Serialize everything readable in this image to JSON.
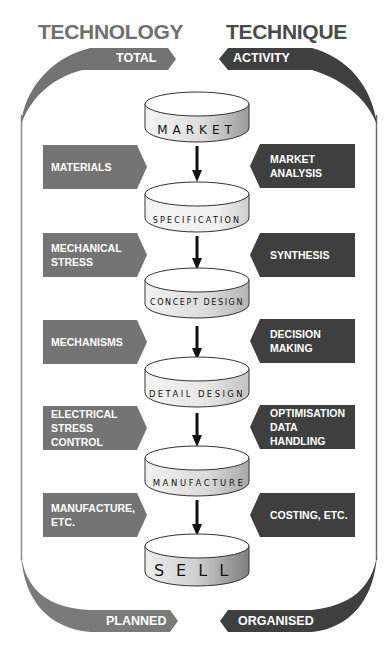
{
  "titles": {
    "left": "TECHNOLOGY",
    "right": "TECHNIQUE"
  },
  "bands": {
    "top_left": "TOTAL",
    "top_right": "ACTIVITY",
    "bottom_left": "PLANNED",
    "bottom_right": "ORGANISED"
  },
  "stages": [
    {
      "label": "MARKET"
    },
    {
      "label": "SPECIFICATION"
    },
    {
      "label": "CONCEPT DESIGN"
    },
    {
      "label": "DETAIL DESIGN"
    },
    {
      "label": "MANUFACTURE"
    },
    {
      "label": "SELL"
    }
  ],
  "technology_boxes": [
    {
      "line1": "MATERIALS",
      "line2": ""
    },
    {
      "line1": "MECHANICAL",
      "line2": "STRESS"
    },
    {
      "line1": "MECHANISMS",
      "line2": ""
    },
    {
      "line1": "ELECTRICAL",
      "line2": "STRESS CONTROL"
    },
    {
      "line1": "MANUFACTURE,",
      "line2": "ETC."
    }
  ],
  "technique_boxes": [
    {
      "line1": "MARKET",
      "line2": "ANALYSIS"
    },
    {
      "line1": "SYNTHESIS",
      "line2": ""
    },
    {
      "line1": "DECISION",
      "line2": "MAKING"
    },
    {
      "line1": "OPTIMISATION",
      "line2": "DATA HANDLING"
    },
    {
      "line1": "COSTING, ETC.",
      "line2": ""
    }
  ],
  "colors": {
    "technology_gray": "#747474",
    "technique_dark": "#3f3f3f",
    "title_left": "#6f6f6f",
    "title_right": "#4a4a4a",
    "arrow": "#111111"
  }
}
